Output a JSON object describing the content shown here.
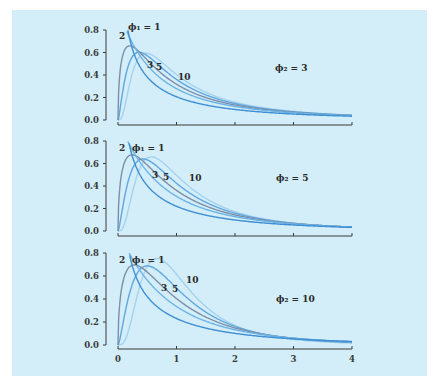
{
  "chart_data": {
    "type": "line",
    "title": "",
    "xlabel": "",
    "ylabel": "",
    "xlim": [
      0,
      4
    ],
    "ylim": [
      0,
      0.8
    ],
    "x_ticks": [
      "0",
      "1",
      "2",
      "3",
      "4"
    ],
    "y_ticks": [
      "0.0",
      "0.2",
      "0.4",
      "0.6",
      "0.8"
    ],
    "grid": false,
    "series_style": [
      {
        "phi1": 1,
        "label": "ϕ₁ = 1",
        "color": "#3f8fd4"
      },
      {
        "phi1": 2,
        "label": "2",
        "color": "#6cb4e6"
      },
      {
        "phi1": 3,
        "label": "3",
        "color": "#7d8ea6"
      },
      {
        "phi1": 5,
        "label": "5",
        "color": "#5fa6df"
      },
      {
        "phi1": 10,
        "label": "10",
        "color": "#a4d2ee"
      }
    ],
    "panels": [
      {
        "phi2": 3,
        "annotation": "ϕ₂ = 3"
      },
      {
        "phi2": 5,
        "annotation": "ϕ₂ = 5"
      },
      {
        "phi2": 10,
        "annotation": "ϕ₂ = 10"
      }
    ],
    "approx_peaks": [
      {
        "phi2": 3,
        "values": {
          "1": 0.8,
          "2": 0.66,
          "3": 0.6,
          "5": 0.59,
          "10": 0.59
        }
      },
      {
        "phi2": 5,
        "values": {
          "1": 0.8,
          "2": 0.67,
          "3": 0.62,
          "5": 0.63,
          "10": 0.65
        }
      },
      {
        "phi2": 10,
        "values": {
          "1": 0.8,
          "2": 0.69,
          "3": 0.67,
          "5": 0.69,
          "10": 0.73
        }
      }
    ]
  },
  "labels": {
    "panel1": {
      "phi1_1": "ϕ₁ = 1",
      "phi1_2": "2",
      "phi1_3": "3",
      "phi1_5": "5",
      "phi1_10": "10",
      "phi2": "ϕ₂ = 3"
    },
    "panel2": {
      "phi1_1": "ϕ₁ = 1",
      "phi1_2": "2",
      "phi1_3": "3",
      "phi1_5": "5",
      "phi1_10": "10",
      "phi2": "ϕ₂ = 5"
    },
    "panel3": {
      "phi1_1": "ϕ₁ = 1",
      "phi1_2": "2",
      "phi1_3": "3",
      "phi1_5": "5",
      "phi1_10": "10",
      "phi2": "ϕ₂ = 10"
    }
  },
  "axis": {
    "y_ticks": [
      "0.0",
      "0.2",
      "0.4",
      "0.6",
      "0.8"
    ],
    "x_ticks": [
      "0",
      "1",
      "2",
      "3",
      "4"
    ]
  }
}
